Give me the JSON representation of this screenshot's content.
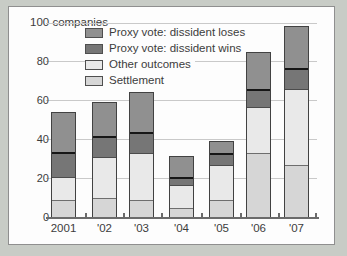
{
  "figure": {
    "background_color": "#c8ccc6",
    "panel_color": "#fdfdfd",
    "gridline_color": "#c9c9c9",
    "axis_color": "#6b6b6b",
    "text_color": "#3c3c3c"
  },
  "chart_data": {
    "type": "bar",
    "stacked": true,
    "title": "100 companies",
    "categories": [
      "2001",
      "'02",
      "'03",
      "'04",
      "'05",
      "'06",
      "'07"
    ],
    "series": [
      {
        "name": "Proxy vote: dissident loses",
        "color": "#909090",
        "values": [
          20,
          17,
          20,
          10,
          6,
          19,
          21
        ]
      },
      {
        "name": "Proxy vote: dissident wins",
        "color": "#767676",
        "values": [
          13,
          11,
          11,
          4,
          6,
          9,
          11
        ]
      },
      {
        "name": "Other outcomes",
        "color": "#e9e9e9",
        "values": [
          12,
          21,
          24,
          12,
          18,
          24,
          39
        ]
      },
      {
        "name": "Settlement",
        "color": "#d6d6d6",
        "values": [
          9,
          10,
          9,
          5,
          9,
          33,
          27
        ]
      }
    ],
    "totals": [
      54,
      59,
      64,
      31,
      39,
      85,
      98
    ],
    "xlabel": "",
    "ylabel": "companies",
    "ylim": [
      0,
      100
    ],
    "yticks": [
      0,
      20,
      40,
      60,
      80,
      100
    ],
    "ytick_labels_shown": [
      "0",
      "20",
      "40",
      "60",
      "80"
    ],
    "grid": true,
    "legend_position": "top-left-inside"
  }
}
